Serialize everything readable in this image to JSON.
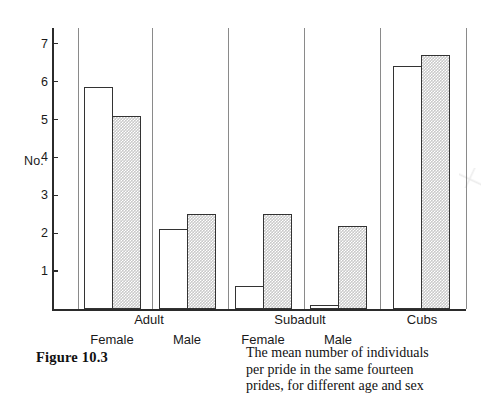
{
  "figure": {
    "number_label": "Figure 10.3",
    "caption_lines": [
      "The mean number of individuals",
      "per pride in the same fourteen",
      "prides, for different age and sex"
    ]
  },
  "chart_data": {
    "type": "bar",
    "title": "",
    "xlabel": "",
    "ylabel": "No.",
    "ylim": [
      0,
      7.6
    ],
    "ytick_labels": [
      "1",
      "2",
      "3",
      "4",
      "5",
      "6",
      "7"
    ],
    "ytick_values": [
      1,
      2,
      3,
      4,
      5,
      6,
      7
    ],
    "grid": false,
    "legend_position": "none",
    "group_labels": [
      "Adult",
      "Subadult",
      "Cubs"
    ],
    "categories": [
      "Adult Female",
      "Adult Male",
      "Subadult Female",
      "Subadult Male",
      "Cubs"
    ],
    "category_sub_labels": [
      "Female",
      "Male",
      "Female",
      "Male",
      ""
    ],
    "series": [
      {
        "name": "open",
        "style": "white-unfilled",
        "values": [
          5.85,
          2.1,
          0.6,
          0.1,
          6.4
        ]
      },
      {
        "name": "hatched",
        "style": "cross-hatched-grey",
        "values": [
          5.1,
          2.5,
          2.5,
          2.2,
          6.7
        ]
      }
    ],
    "bars": [
      {
        "group": "Adult",
        "sub": "Female",
        "series": "open",
        "value": 5.85,
        "x": 84,
        "width": 29
      },
      {
        "group": "Adult",
        "sub": "Female",
        "series": "hatched",
        "value": 5.1,
        "x": 112,
        "width": 29
      },
      {
        "group": "Adult",
        "sub": "Male",
        "series": "open",
        "value": 2.1,
        "x": 159,
        "width": 29
      },
      {
        "group": "Adult",
        "sub": "Male",
        "series": "hatched",
        "value": 2.5,
        "x": 187,
        "width": 29
      },
      {
        "group": "Subadult",
        "sub": "Female",
        "series": "open",
        "value": 0.6,
        "x": 235,
        "width": 29
      },
      {
        "group": "Subadult",
        "sub": "Female",
        "series": "hatched",
        "value": 2.5,
        "x": 263,
        "width": 29
      },
      {
        "group": "Subadult",
        "sub": "Male",
        "series": "open",
        "value": 0.1,
        "x": 310,
        "width": 29
      },
      {
        "group": "Subadult",
        "sub": "Male",
        "series": "hatched",
        "value": 2.2,
        "x": 338,
        "width": 29
      },
      {
        "group": "Cubs",
        "sub": "",
        "series": "open",
        "value": 6.4,
        "x": 393,
        "width": 29
      },
      {
        "group": "Cubs",
        "sub": "",
        "series": "hatched",
        "value": 6.7,
        "x": 421,
        "width": 29
      }
    ],
    "group_label_positions": [
      {
        "label": "Adult",
        "center": 149
      },
      {
        "label": "Subadult",
        "center": 300
      },
      {
        "label": "Cubs",
        "center": 422
      }
    ],
    "sub_label_positions": [
      {
        "label": "Female",
        "center": 112
      },
      {
        "label": "Male",
        "center": 187
      },
      {
        "label": "Female",
        "center": 263
      },
      {
        "label": "Male",
        "center": 338
      }
    ],
    "separators_x": [
      78,
      152,
      228,
      304,
      380,
      466
    ],
    "axis": {
      "baseline_y": 309,
      "top_y": 28,
      "px_per_unit": 37.9,
      "left_x": 52,
      "right_x": 466
    }
  }
}
